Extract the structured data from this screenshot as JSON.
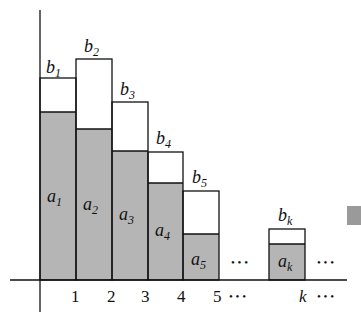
{
  "diagram": {
    "colors": {
      "shade": "#b5b5b5",
      "line": "#111111",
      "marker": "#9a9a9a"
    },
    "bars": [
      {
        "index": "1",
        "upper": "b",
        "upper_sub": "1",
        "lower": "a",
        "lower_sub": "1"
      },
      {
        "index": "2",
        "upper": "b",
        "upper_sub": "2",
        "lower": "a",
        "lower_sub": "2"
      },
      {
        "index": "3",
        "upper": "b",
        "upper_sub": "3",
        "lower": "a",
        "lower_sub": "3"
      },
      {
        "index": "4",
        "upper": "b",
        "upper_sub": "4",
        "lower": "a",
        "lower_sub": "4"
      },
      {
        "index": "5",
        "upper": "b",
        "upper_sub": "5",
        "lower": "a",
        "lower_sub": "5"
      },
      {
        "index": "k",
        "upper": "b",
        "upper_sub": "k",
        "lower": "a",
        "lower_sub": "k"
      }
    ],
    "ellipsis": "• • •"
  }
}
